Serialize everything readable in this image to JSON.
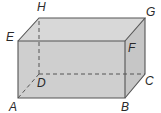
{
  "diagram": {
    "type": "cuboid",
    "fill_color": "#cfcfcf",
    "top_fill_color": "#d6d6d6",
    "side_fill_color": "#c9c9c9",
    "edge_color": "#555555",
    "vertices": {
      "A": {
        "label": "A",
        "x": 18,
        "y": 98
      },
      "B": {
        "label": "B",
        "x": 125,
        "y": 98
      },
      "C": {
        "label": "C",
        "x": 145,
        "y": 74
      },
      "D": {
        "label": "D",
        "x": 39,
        "y": 74
      },
      "E": {
        "label": "E",
        "x": 18,
        "y": 41
      },
      "F": {
        "label": "F",
        "x": 125,
        "y": 41
      },
      "G": {
        "label": "G",
        "x": 145,
        "y": 18
      },
      "H": {
        "label": "H",
        "x": 39,
        "y": 18
      }
    },
    "visible_edges": [
      "AB",
      "BF",
      "FE",
      "EA",
      "EH",
      "HG",
      "GF",
      "GC",
      "CB"
    ],
    "hidden_edges": [
      "AD",
      "DC",
      "DH"
    ]
  }
}
